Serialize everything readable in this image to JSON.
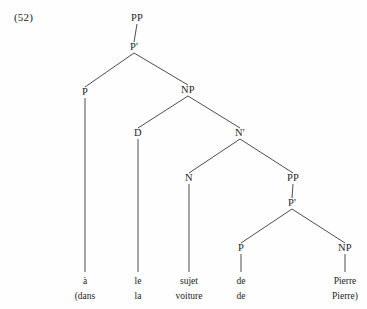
{
  "example": {
    "number_label": "(52)"
  },
  "chart_data": {
    "type": "diagram",
    "diagram_kind": "syntax-tree",
    "title": "(52)",
    "nodes": [
      {
        "id": "PP1",
        "label": "PP",
        "x": 137,
        "y": 21,
        "level": 0
      },
      {
        "id": "Pbar1",
        "label": "P'",
        "x": 134,
        "y": 50,
        "level": 1
      },
      {
        "id": "P1",
        "label": "P",
        "x": 85,
        "y": 95,
        "level": 2
      },
      {
        "id": "NP1",
        "label": "NP",
        "x": 188,
        "y": 93,
        "level": 2
      },
      {
        "id": "D1",
        "label": "D",
        "x": 138,
        "y": 136,
        "level": 3
      },
      {
        "id": "Nbar1",
        "label": "N'",
        "x": 240,
        "y": 136,
        "level": 3
      },
      {
        "id": "N1",
        "label": "N",
        "x": 189,
        "y": 181,
        "level": 4
      },
      {
        "id": "PP2",
        "label": "PP",
        "x": 293,
        "y": 181,
        "level": 4
      },
      {
        "id": "Pbar2",
        "label": "P'",
        "x": 292,
        "y": 206,
        "level": 5
      },
      {
        "id": "P2",
        "label": "P",
        "x": 241,
        "y": 251,
        "level": 6
      },
      {
        "id": "NP2",
        "label": "NP",
        "x": 345,
        "y": 251,
        "level": 6
      }
    ],
    "edges": [
      {
        "from": "PP1",
        "to": "Pbar1"
      },
      {
        "from": "Pbar1",
        "to": "P1"
      },
      {
        "from": "Pbar1",
        "to": "NP1"
      },
      {
        "from": "NP1",
        "to": "D1"
      },
      {
        "from": "NP1",
        "to": "Nbar1"
      },
      {
        "from": "Nbar1",
        "to": "N1"
      },
      {
        "from": "Nbar1",
        "to": "PP2"
      },
      {
        "from": "PP2",
        "to": "Pbar2"
      },
      {
        "from": "Pbar2",
        "to": "P2"
      },
      {
        "from": "Pbar2",
        "to": "NP2"
      }
    ],
    "leaves": [
      {
        "parent": "P1",
        "x": 85,
        "word": "à",
        "gloss": "(dans"
      },
      {
        "parent": "D1",
        "x": 138,
        "word": "le",
        "gloss": "la"
      },
      {
        "parent": "N1",
        "x": 189,
        "word": "sujet",
        "gloss": "voiture"
      },
      {
        "parent": "P2",
        "x": 241,
        "word": "de",
        "gloss": "de"
      },
      {
        "parent": "NP2",
        "x": 345,
        "word": "Pierre",
        "gloss": "Pierre)"
      }
    ],
    "leaf_line_bottom": 272,
    "word_baseline": 284,
    "gloss_baseline": 299,
    "colors": {
      "background": "#fefefe",
      "line": "#3a3a3a",
      "text": "#1f1f1f"
    }
  }
}
